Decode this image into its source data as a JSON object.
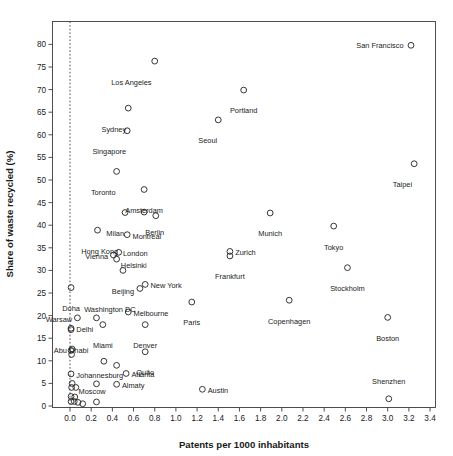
{
  "chart_data": {
    "type": "scatter",
    "title": "",
    "xlabel": "Patents per 1000 inhabitants",
    "ylabel": "Share of waste recycled (%)",
    "xlim": [
      -0.16,
      3.48
    ],
    "ylim": [
      -2.4,
      85.5
    ],
    "xticks": [
      "0.0",
      "0.2",
      "0.4",
      "0.6",
      "0.8",
      "1.0",
      "1.2",
      "1.4",
      "1.6",
      "1.8",
      "2.0",
      "2.2",
      "2.4",
      "2.6",
      "2.8",
      "3.0",
      "3.2",
      "3.4"
    ],
    "xtick_values": [
      0.0,
      0.2,
      0.4,
      0.6,
      0.8,
      1.0,
      1.2,
      1.4,
      1.6,
      1.8,
      2.0,
      2.2,
      2.4,
      2.6,
      2.8,
      3.0,
      3.2,
      3.4
    ],
    "yticks": [
      "0",
      "5",
      "10",
      "15",
      "20",
      "25",
      "30",
      "35",
      "40",
      "45",
      "50",
      "55",
      "60",
      "65",
      "70",
      "75",
      "80"
    ],
    "ytick_values": [
      0,
      5,
      10,
      15,
      20,
      25,
      30,
      35,
      40,
      45,
      50,
      55,
      60,
      65,
      70,
      75,
      80
    ],
    "grid": false,
    "legend": null,
    "marker_style": "open-circle",
    "annotations": [
      {
        "name": "reference-line",
        "type": "vline",
        "x": 0.0,
        "style": "dotted"
      }
    ],
    "points": [
      {
        "label": "San Francisco",
        "x": 3.22,
        "y": 79.8,
        "lx": -0.07,
        "ly": 0.0,
        "anchor": "end"
      },
      {
        "label": "Los Angeles",
        "x": 0.8,
        "y": 76.3,
        "lx": -0.03,
        "ly": -4.6,
        "anchor": "end"
      },
      {
        "label": "Portland",
        "x": 1.64,
        "y": 69.9,
        "lx": 0.0,
        "ly": -4.6,
        "anchor": "mid"
      },
      {
        "label": "Sydney",
        "x": 0.55,
        "y": 65.9,
        "lx": -0.02,
        "ly": -4.6,
        "anchor": "end"
      },
      {
        "label": "Seoul",
        "x": 1.4,
        "y": 63.3,
        "lx": -0.01,
        "ly": -4.6,
        "anchor": "end"
      },
      {
        "label": "Singapore",
        "x": 0.54,
        "y": 60.9,
        "lx": -0.01,
        "ly": -4.6,
        "anchor": "end"
      },
      {
        "label": "Taipei",
        "x": 3.25,
        "y": 53.6,
        "lx": -0.02,
        "ly": -4.6,
        "anchor": "end"
      },
      {
        "label": "Toronto",
        "x": 0.44,
        "y": 51.9,
        "lx": -0.01,
        "ly": -4.6,
        "anchor": "end"
      },
      {
        "label": "Amsterdam",
        "x": 0.7,
        "y": 47.9,
        "lx": 0.0,
        "ly": -4.6,
        "anchor": "mid"
      },
      {
        "label": "Milan",
        "x": 0.52,
        "y": 42.8,
        "lx": -0.01,
        "ly": -4.6,
        "anchor": "end"
      },
      {
        "label": "Berlin",
        "x": 0.7,
        "y": 42.9,
        "lx": 0.1,
        "ly": -4.6,
        "anchor": "mid"
      },
      {
        "label": "",
        "x": 0.81,
        "y": 42.1,
        "lx": 0.0,
        "ly": 0.0,
        "anchor": "mid"
      },
      {
        "label": "Munich",
        "x": 1.89,
        "y": 42.7,
        "lx": 0.0,
        "ly": -4.6,
        "anchor": "mid"
      },
      {
        "label": "Tokyo",
        "x": 2.49,
        "y": 39.8,
        "lx": 0.0,
        "ly": -4.6,
        "anchor": "mid"
      },
      {
        "label": "Hong Kong",
        "x": 0.26,
        "y": 38.9,
        "lx": 0.02,
        "ly": -4.6,
        "anchor": "mid"
      },
      {
        "label": "Montreal",
        "x": 0.54,
        "y": 37.9,
        "lx": 0.05,
        "ly": -0.3,
        "anchor": "start"
      },
      {
        "label": "Zurich",
        "x": 1.51,
        "y": 34.2,
        "lx": 0.05,
        "ly": -0.3,
        "anchor": "start"
      },
      {
        "label": "London",
        "x": 0.46,
        "y": 34.0,
        "lx": 0.04,
        "ly": -0.3,
        "anchor": "start"
      },
      {
        "label": "Vienna",
        "x": 0.41,
        "y": 33.4,
        "lx": -0.05,
        "ly": -0.3,
        "anchor": "end"
      },
      {
        "label": "Helsinki",
        "x": 0.44,
        "y": 32.5,
        "lx": 0.04,
        "ly": -1.3,
        "anchor": "start"
      },
      {
        "label": "Frankfurt",
        "x": 1.51,
        "y": 33.2,
        "lx": 0.0,
        "ly": -4.6,
        "anchor": "mid"
      },
      {
        "label": "Stockholm",
        "x": 2.62,
        "y": 30.6,
        "lx": 0.0,
        "ly": -4.6,
        "anchor": "mid"
      },
      {
        "label": "Beijing",
        "x": 0.5,
        "y": 30.0,
        "lx": 0.0,
        "ly": -4.6,
        "anchor": "mid"
      },
      {
        "label": "New York",
        "x": 0.71,
        "y": 26.9,
        "lx": 0.05,
        "ly": -0.3,
        "anchor": "start"
      },
      {
        "label": "Doha",
        "x": 0.01,
        "y": 26.2,
        "lx": 0.0,
        "ly": -4.6,
        "anchor": "mid"
      },
      {
        "label": "Washington DC",
        "x": 0.66,
        "y": 26.0,
        "lx": -0.04,
        "ly": -4.6,
        "anchor": "end"
      },
      {
        "label": "Paris",
        "x": 1.15,
        "y": 23.0,
        "lx": 0.0,
        "ly": -4.6,
        "anchor": "mid"
      },
      {
        "label": "Copenhagen",
        "x": 2.07,
        "y": 23.4,
        "lx": 0.0,
        "ly": -4.6,
        "anchor": "mid"
      },
      {
        "label": "Melbourne",
        "x": 0.55,
        "y": 20.8,
        "lx": 0.05,
        "ly": -0.3,
        "anchor": "start"
      },
      {
        "label": "Warsaw",
        "x": 0.07,
        "y": 19.5,
        "lx": -0.05,
        "ly": -0.3,
        "anchor": "end"
      },
      {
        "label": "",
        "x": 0.25,
        "y": 19.5,
        "lx": 0.0,
        "ly": 0.0,
        "anchor": "mid"
      },
      {
        "label": "Boston",
        "x": 3.0,
        "y": 19.6,
        "lx": 0.0,
        "ly": -4.6,
        "anchor": "mid"
      },
      {
        "label": "Miami",
        "x": 0.31,
        "y": 18.0,
        "lx": 0.0,
        "ly": -4.6,
        "anchor": "mid"
      },
      {
        "label": "Denver",
        "x": 0.71,
        "y": 18.0,
        "lx": 0.0,
        "ly": -4.6,
        "anchor": "mid"
      },
      {
        "label": "Delhi",
        "x": 0.01,
        "y": 17.2,
        "lx": 0.05,
        "ly": -0.3,
        "anchor": "start"
      },
      {
        "label": "Abu Dhabi",
        "x": 0.01,
        "y": 16.9,
        "lx": 0.0,
        "ly": -4.6,
        "anchor": "mid"
      },
      {
        "label": "",
        "x": 0.02,
        "y": 12.6,
        "lx": 0.0,
        "ly": 0.0,
        "anchor": "mid"
      },
      {
        "label": "",
        "x": 0.01,
        "y": 12.3,
        "lx": 0.0,
        "ly": 0.0,
        "anchor": "mid"
      },
      {
        "label": "",
        "x": 0.015,
        "y": 11.4,
        "lx": 0.0,
        "ly": 0.0,
        "anchor": "mid"
      },
      {
        "label": "Quito",
        "x": 0.71,
        "y": 12.0,
        "lx": 0.0,
        "ly": -4.6,
        "anchor": "mid"
      },
      {
        "label": "",
        "x": 0.32,
        "y": 9.9,
        "lx": 0.0,
        "ly": 0.0,
        "anchor": "mid"
      },
      {
        "label": "",
        "x": 0.44,
        "y": 9.0,
        "lx": 0.0,
        "ly": 0.0,
        "anchor": "mid"
      },
      {
        "label": "Johannesburg",
        "x": 0.01,
        "y": 7.1,
        "lx": 0.05,
        "ly": -0.3,
        "anchor": "start"
      },
      {
        "label": "Atlanta",
        "x": 0.53,
        "y": 7.2,
        "lx": 0.05,
        "ly": -0.3,
        "anchor": "start"
      },
      {
        "label": "Almaty",
        "x": 0.44,
        "y": 4.8,
        "lx": 0.05,
        "ly": -0.3,
        "anchor": "start"
      },
      {
        "label": "",
        "x": 0.25,
        "y": 4.9,
        "lx": 0.0,
        "ly": 0.0,
        "anchor": "mid"
      },
      {
        "label": "Moscow",
        "x": 0.02,
        "y": 5.0,
        "lx": 0.06,
        "ly": -1.7,
        "anchor": "start"
      },
      {
        "label": "",
        "x": 0.015,
        "y": 4.1,
        "lx": 0.0,
        "ly": 0.0,
        "anchor": "mid"
      },
      {
        "label": "",
        "x": 0.055,
        "y": 4.1,
        "lx": 0.0,
        "ly": 0.0,
        "anchor": "mid"
      },
      {
        "label": "Austin",
        "x": 1.25,
        "y": 3.7,
        "lx": 0.05,
        "ly": -0.3,
        "anchor": "start"
      },
      {
        "label": "Shenzhen",
        "x": 3.01,
        "y": 1.6,
        "lx": 0.0,
        "ly": 3.8,
        "anchor": "mid"
      },
      {
        "label": "",
        "x": 0.01,
        "y": 2.1,
        "lx": 0.0,
        "ly": 0.0,
        "anchor": "mid"
      },
      {
        "label": "",
        "x": 0.045,
        "y": 2.0,
        "lx": 0.0,
        "ly": 0.0,
        "anchor": "mid"
      },
      {
        "label": "",
        "x": 0.01,
        "y": 1.0,
        "lx": 0.0,
        "ly": 0.0,
        "anchor": "mid"
      },
      {
        "label": "",
        "x": 0.04,
        "y": 1.0,
        "lx": 0.0,
        "ly": 0.0,
        "anchor": "mid"
      },
      {
        "label": "",
        "x": 0.075,
        "y": 0.8,
        "lx": 0.0,
        "ly": 0.0,
        "anchor": "mid"
      },
      {
        "label": "",
        "x": 0.12,
        "y": 0.5,
        "lx": 0.0,
        "ly": 0.0,
        "anchor": "mid"
      },
      {
        "label": "",
        "x": 0.25,
        "y": 0.9,
        "lx": 0.0,
        "ly": 0.0,
        "anchor": "mid"
      }
    ]
  },
  "colors": {
    "axis": "#3b3b3b",
    "marker_stroke": "#2b2b2b",
    "text": "#1a1a1a",
    "background": "#ffffff"
  }
}
